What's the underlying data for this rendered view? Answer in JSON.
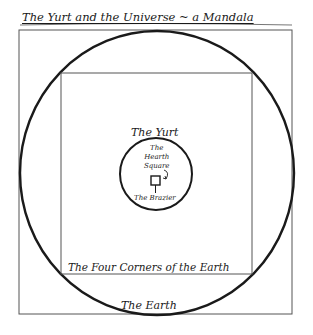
{
  "title": "The Yurt and the Universe ~ a Mandala",
  "labels": {
    "yurt": "The Yurt",
    "hearth_line1": "The",
    "hearth_line2": "Hearth",
    "hearth_line3": "Square",
    "brazier": "The Brazier",
    "four_corners": "The Four Corners of the Earth",
    "earth": "The Earth"
  },
  "colors": {
    "ink": "#1a1a1a",
    "thin_line": "#555555",
    "background": "#ffffff"
  }
}
